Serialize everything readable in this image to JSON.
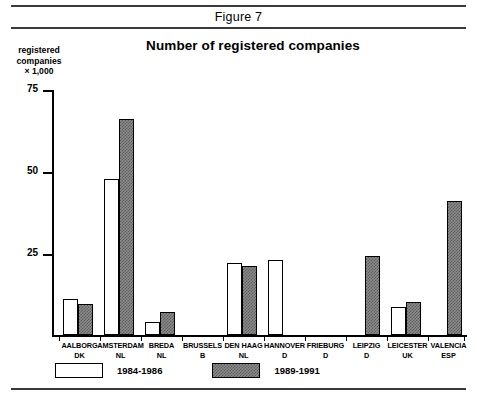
{
  "figure": {
    "label": "Figure 7"
  },
  "chart_data": {
    "type": "bar",
    "title": "Number of registered companies",
    "xlabel": "",
    "ylabel": "registered companies × 1,000",
    "ylabel_lines": [
      "registered",
      "companies",
      "× 1,000"
    ],
    "ylim": [
      0,
      75
    ],
    "yticks": [
      25,
      50,
      75
    ],
    "ytick_labels": [
      "25",
      "50",
      "75"
    ],
    "grid": false,
    "legend_position": "bottom-left",
    "categories": [
      "AALBORG DK",
      "AMSTERDAM NL",
      "BREDA NL",
      "BRUSSELS B",
      "DEN HAAG NL",
      "HANNOVER D",
      "FRIEBURG D",
      "LEIPZIG D",
      "LEICESTER UK",
      "VALENCIA ESP"
    ],
    "category_labels": [
      {
        "line1": "AALBORG",
        "line2": "DK"
      },
      {
        "line1": "AMSTERDAM",
        "line2": "NL"
      },
      {
        "line1": "BREDA",
        "line2": "NL"
      },
      {
        "line1": "BRUSSELS",
        "line2": "B"
      },
      {
        "line1": "DEN HAAG",
        "line2": "NL"
      },
      {
        "line1": "HANNOVER",
        "line2": "D"
      },
      {
        "line1": "FRIEBURG",
        "line2": "D"
      },
      {
        "line1": "LEIPZIG",
        "line2": "D"
      },
      {
        "line1": "LEICESTER",
        "line2": "UK"
      },
      {
        "line1": "VALENCIA",
        "line2": "ESP"
      }
    ],
    "series": [
      {
        "name": "1984-1986",
        "style": "white",
        "values": [
          11,
          47.5,
          4,
          null,
          22,
          23,
          null,
          null,
          8.5,
          null
        ]
      },
      {
        "name": "1989-1991",
        "style": "gray-hatched",
        "values": [
          9.5,
          66,
          7,
          null,
          21,
          null,
          null,
          24,
          10,
          41
        ]
      }
    ],
    "legend": [
      {
        "label": "1984-1986",
        "style": "white"
      },
      {
        "label": "1989-1991",
        "style": "gray-hatched"
      }
    ]
  }
}
